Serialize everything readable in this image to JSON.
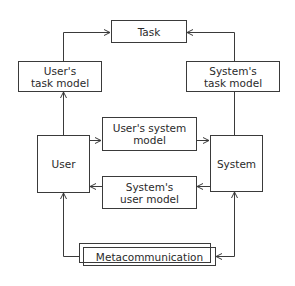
{
  "diagram": {
    "type": "flow",
    "nodes": {
      "task": "Task",
      "users_task_model": "User's\ntask model",
      "systems_task_model": "System's\ntask model",
      "user": "User",
      "system": "System",
      "users_system_model": "User's system\nmodel",
      "systems_user_model": "System's\nuser model",
      "metacommunication": "Metacommunication"
    },
    "edges": [
      {
        "from": "User",
        "to": "User's task model"
      },
      {
        "from": "User's task model",
        "to": "Task"
      },
      {
        "from": "System",
        "to": "System's task model"
      },
      {
        "from": "System's task model",
        "to": "Task"
      },
      {
        "from": "User",
        "to": "User's system model"
      },
      {
        "from": "User's system model",
        "to": "System"
      },
      {
        "from": "System",
        "to": "System's user model"
      },
      {
        "from": "System's user model",
        "to": "User"
      },
      {
        "from": "Metacommunication",
        "to": "User"
      },
      {
        "from": "Metacommunication",
        "to": "System"
      },
      {
        "from": "System",
        "to": "Metacommunication"
      }
    ],
    "line_color": "#3a3a3a"
  }
}
